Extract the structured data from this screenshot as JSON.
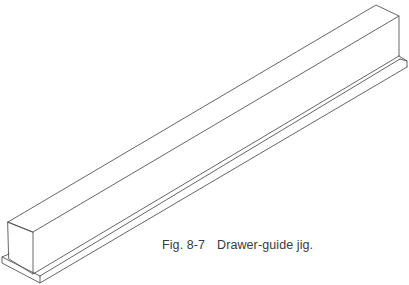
{
  "figure": {
    "number": "Fig. 8-7",
    "title": "Drawer-guide jig.",
    "line_color": "#555555"
  }
}
